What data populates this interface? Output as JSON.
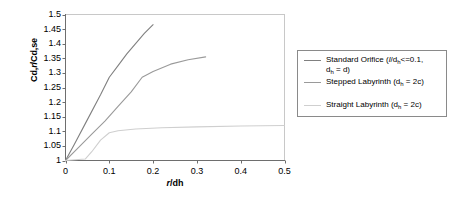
{
  "chart_data": {
    "type": "line",
    "title": "",
    "xlabel": "r/dh",
    "ylabel": "Cd,r/Cd,se",
    "xlim": [
      0,
      0.5
    ],
    "ylim": [
      1,
      1.5
    ],
    "xticks": [
      "0",
      "0.1",
      "0.2",
      "0.3",
      "0.4",
      "0.5"
    ],
    "xtick_values": [
      0,
      0.1,
      0.2,
      0.3,
      0.4,
      0.5
    ],
    "yticks": [
      "1",
      "1.05",
      "1.1",
      "1.15",
      "1.2",
      "1.25",
      "1.3",
      "1.35",
      "1.4",
      "1.45",
      "1.5"
    ],
    "ytick_values": [
      1,
      1.05,
      1.1,
      1.15,
      1.2,
      1.25,
      1.3,
      1.35,
      1.4,
      1.45,
      1.5
    ],
    "grid": false,
    "legend_position": "right",
    "series": [
      {
        "name": "Standard Orifice (l/dh<=0.1, dh = d)",
        "color": "#808080",
        "x": [
          0,
          0.02,
          0.05,
          0.08,
          0.1,
          0.12,
          0.14,
          0.16,
          0.18,
          0.2
        ],
        "y": [
          1.0,
          1.055,
          1.14,
          1.225,
          1.285,
          1.325,
          1.365,
          1.4,
          1.435,
          1.465
        ]
      },
      {
        "name": "Stepped Labyrinth (dh = 2c)",
        "color": "#9a9a9a",
        "x": [
          0,
          0.03,
          0.06,
          0.09,
          0.12,
          0.15,
          0.175,
          0.2,
          0.24,
          0.28,
          0.32
        ],
        "y": [
          1.0,
          1.045,
          1.09,
          1.135,
          1.185,
          1.235,
          1.285,
          1.305,
          1.33,
          1.345,
          1.355
        ]
      },
      {
        "name": "Straight Labyrinth (dh = 2c)",
        "color": "#cfcfcf",
        "x": [
          0,
          0.045,
          0.06,
          0.08,
          0.1,
          0.12,
          0.16,
          0.22,
          0.3,
          0.4,
          0.5
        ],
        "y": [
          1.0,
          1.005,
          1.03,
          1.07,
          1.095,
          1.102,
          1.108,
          1.112,
          1.115,
          1.118,
          1.12
        ]
      }
    ]
  },
  "legend": {
    "items": [
      {
        "label_line1_a": "Standard Orifice (",
        "label_line1_it": "l",
        "label_line1_b": "/d",
        "label_line1_sub": "h",
        "label_line1_c": "<=0.1,",
        "label_line2_a": "d",
        "label_line2_sub": "h",
        "label_line2_b": " = d)"
      },
      {
        "label_line1_a": "Stepped Labyrinth (d",
        "label_line1_sub": "h",
        "label_line1_c": " = 2c)"
      },
      {
        "label_line1_a": "Straight Labyrinth (d",
        "label_line1_sub": "h",
        "label_line1_c": " = 2c)"
      }
    ]
  },
  "axes": {
    "ylabel_a": "Cd,",
    "ylabel_it": "r",
    "ylabel_b": "/Cd,se",
    "xlabel_it": "r",
    "xlabel_b": "/dh"
  }
}
